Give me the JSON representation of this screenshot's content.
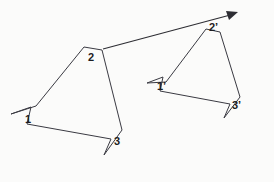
{
  "diagram": {
    "background_color": "#fbfbfa",
    "stroke_color": "#3a3a42",
    "arrow_color": "#2d2d33",
    "label_color": "#1d1d22",
    "canvas": {
      "width": 274,
      "height": 182
    },
    "preimage": {
      "name": "polygon-1-2-3",
      "path": "M 11,114 L 31,107 L 27,124 L 111,139 L 104,155 L 122,130 L 102,50 L 84,47 L 36,106 Z",
      "labels": [
        {
          "id": "label-1",
          "text": "1",
          "x": 25,
          "y": 119
        },
        {
          "id": "label-2",
          "text": "2",
          "x": 88,
          "y": 58
        },
        {
          "id": "label-3",
          "text": "3",
          "x": 114,
          "y": 141
        }
      ]
    },
    "image": {
      "name": "polygon-1p-2p-3p",
      "path": "M 147,83 L 163,77 L 160,91 L 230,104 L 224,118 L 240,97 L 220,32 L 206,29 L 166,82 Z",
      "labels": [
        {
          "id": "label-1-prime",
          "text": "1’",
          "x": 158,
          "y": 86
        },
        {
          "id": "label-2-prime",
          "text": "2’",
          "x": 209,
          "y": 27
        },
        {
          "id": "label-3-prime",
          "text": "3’",
          "x": 232,
          "y": 105
        }
      ]
    },
    "translation_vector": {
      "name": "translation-arrow-2-to-2prime",
      "from": {
        "x": 103,
        "y": 49
      },
      "to": {
        "x": 237,
        "y": 13
      },
      "line_path": "M 103,49 L 234,14",
      "arrow_head_points": "238,12 226,11 229,20"
    },
    "notes": {
      "correspondence": "Vertices 1, 2, 3 map to 1’, 2’, 3’ under the translation."
    }
  }
}
